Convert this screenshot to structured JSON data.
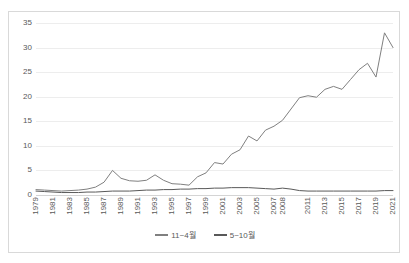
{
  "chart_data": {
    "type": "line",
    "title": "",
    "subtitle": "",
    "xlabel": "",
    "ylabel": "",
    "ylim": [
      0,
      35
    ],
    "ytick_values": [
      0,
      5,
      10,
      15,
      20,
      25,
      30,
      35
    ],
    "ytick_labels": [
      "0",
      "5",
      "10",
      "15",
      "20",
      "25",
      "30",
      "35"
    ],
    "grid": "horizontal",
    "legend_position": "bottom",
    "x": [
      1979,
      1980,
      1981,
      1982,
      1983,
      1984,
      1985,
      1986,
      1987,
      1988,
      1989,
      1990,
      1991,
      1992,
      1993,
      1994,
      1995,
      1996,
      1997,
      1998,
      1999,
      2000,
      2001,
      2002,
      2003,
      2004,
      2005,
      2006,
      2007,
      2008,
      2009,
      2010,
      2011,
      2012,
      2013,
      2014,
      2015,
      2016,
      2017,
      2018,
      2019,
      2020,
      2021
    ],
    "xtick_labels": [
      "1979",
      "1981",
      "1983",
      "1985",
      "1987",
      "1989",
      "1991",
      "1993",
      "1995",
      "1997",
      "1999",
      "2001",
      "2003",
      "2005",
      "2007",
      "2008",
      "2011",
      "2013",
      "2015",
      "2017",
      "2019",
      "2021"
    ],
    "xtick_positions": [
      1979,
      1981,
      1983,
      1985,
      1987,
      1989,
      1991,
      1993,
      1995,
      1997,
      1999,
      2001,
      2003,
      2005,
      2007,
      2008,
      2011,
      2013,
      2015,
      2017,
      2019,
      2021
    ],
    "series": [
      {
        "name": "11~4월",
        "color": "#808080",
        "values": [
          1.1,
          1.0,
          0.9,
          0.8,
          0.9,
          1.0,
          1.2,
          1.6,
          2.6,
          5.0,
          3.4,
          2.9,
          2.8,
          3.0,
          4.1,
          3.0,
          2.3,
          2.2,
          2.0,
          3.7,
          4.5,
          6.6,
          6.3,
          8.3,
          9.2,
          12.0,
          11.0,
          13.2,
          14.0,
          15.2,
          17.5,
          19.8,
          20.2,
          19.9,
          21.5,
          22.1,
          21.5,
          23.5,
          25.5,
          26.8,
          24.0,
          33.0,
          30.0
        ]
      },
      {
        "name": "5~10월",
        "color": "#595959",
        "values": [
          0.8,
          0.7,
          0.6,
          0.5,
          0.5,
          0.5,
          0.6,
          0.6,
          0.7,
          0.8,
          0.8,
          0.8,
          0.9,
          1.0,
          1.0,
          1.1,
          1.1,
          1.2,
          1.2,
          1.3,
          1.3,
          1.4,
          1.4,
          1.5,
          1.5,
          1.5,
          1.4,
          1.3,
          1.2,
          1.4,
          1.2,
          0.9,
          0.8,
          0.8,
          0.8,
          0.8,
          0.8,
          0.8,
          0.8,
          0.8,
          0.8,
          0.9,
          0.9
        ]
      }
    ]
  },
  "legend": {
    "items": [
      {
        "label": "11~4월",
        "color": "#808080"
      },
      {
        "label": "5~10월",
        "color": "#595959"
      }
    ]
  }
}
